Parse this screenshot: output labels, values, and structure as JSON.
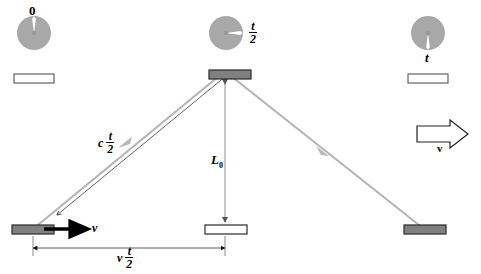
{
  "figure": {
    "type": "physics-diagram"
  },
  "colors": {
    "clock_face": "#a8a8a8",
    "clock_hand": "#ffffff",
    "mirror_fill_gray": "#808080",
    "mirror_fill_white": "#ffffff",
    "mirror_stroke": "#3a3a3a",
    "light_ray": "#b5b5b5",
    "dimension_line": "#808080",
    "text": "#000000"
  },
  "clocks": [
    {
      "name": "clock-start",
      "label": "0",
      "hand_direction": "up",
      "hand_angle_deg": 0,
      "label_position": "above"
    },
    {
      "name": "clock-middle",
      "label_num": "t",
      "label_den": "2",
      "hand_direction": "right",
      "hand_angle_deg": 90,
      "label_position": "right"
    },
    {
      "name": "clock-end",
      "label": "t",
      "hand_direction": "down",
      "hand_angle_deg": 180,
      "label_position": "below"
    }
  ],
  "labels": {
    "ray_left_prefix": "c",
    "ray_left_num": "t",
    "ray_left_den": "2",
    "vertical_length": "L",
    "vertical_length_sub": "0",
    "baseline_prefix": "v",
    "baseline_num": "t",
    "baseline_den": "2",
    "velocity_arrow_small": "v",
    "velocity_arrow_big": "v"
  },
  "mirrors": [
    {
      "name": "mirror-top-detector",
      "fill": "gray",
      "position": "apex"
    },
    {
      "name": "mirror-bottom-start",
      "fill": "gray",
      "position": "bottom-left"
    },
    {
      "name": "mirror-bottom-middle",
      "fill": "white",
      "position": "bottom-center"
    },
    {
      "name": "mirror-bottom-end",
      "fill": "gray",
      "position": "bottom-right"
    },
    {
      "name": "mirror-ghost-left",
      "fill": "white",
      "position": "top-left"
    },
    {
      "name": "mirror-ghost-right",
      "fill": "white",
      "position": "top-right"
    }
  ],
  "rays": [
    {
      "name": "ray-upward",
      "from": "bottom-left mirror",
      "to": "apex detector",
      "arrow": "midpoint"
    },
    {
      "name": "ray-downward",
      "from": "apex detector",
      "to": "bottom-right mirror",
      "arrow": "midpoint"
    },
    {
      "name": "ray-vertical",
      "from": "bottom-center mirror",
      "to": "apex detector",
      "arrow": "both-ends"
    }
  ]
}
